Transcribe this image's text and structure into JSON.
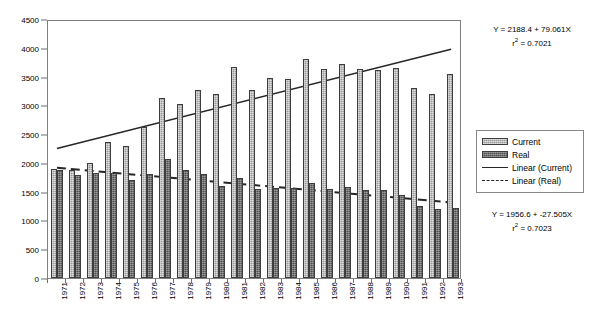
{
  "chart_data": {
    "type": "bar",
    "title": "",
    "xlabel": "",
    "ylabel": "",
    "ylim": [
      0,
      4500
    ],
    "ytick_step": 500,
    "yticks": [
      "0",
      "500",
      "1000",
      "1500",
      "2000",
      "2500",
      "3000",
      "3500",
      "4000",
      "4500"
    ],
    "grid": false,
    "legend_position": "right",
    "categories": [
      "1971",
      "1972",
      "1973",
      "1974",
      "1975",
      "1976",
      "1977",
      "1978",
      "1979",
      "1980",
      "1981",
      "1982",
      "1983",
      "1984",
      "1985",
      "1986",
      "1987",
      "1988",
      "1989",
      "1990",
      "1991",
      "1992",
      "1993"
    ],
    "series": [
      {
        "name": "Current",
        "color": "#9a9a9a",
        "values": [
          1900,
          1880,
          1990,
          2360,
          2300,
          2630,
          3130,
          3030,
          3270,
          3200,
          3660,
          3260,
          3480,
          3450,
          3800,
          3640,
          3710,
          3640,
          3620,
          3650,
          3310,
          3200,
          3540
        ]
      },
      {
        "name": "Real",
        "color": "#4f4f4f",
        "values": [
          1870,
          1790,
          1830,
          1820,
          1700,
          1800,
          2060,
          1870,
          1800,
          1600,
          1740,
          1550,
          1570,
          1560,
          1650,
          1540,
          1590,
          1530,
          1530,
          1440,
          1250,
          1200,
          1220
        ]
      }
    ],
    "trendlines": [
      {
        "name": "Linear (Current)",
        "style": "solid",
        "color": "#262626",
        "intercept": 2188.4,
        "slope": 79.061,
        "r_squared": 0.7021,
        "equation": "Y = 2188.4 + 79.061X",
        "r2_label": "= 0.7021"
      },
      {
        "name": "Linear (Real)",
        "style": "dashed",
        "color": "#262626",
        "intercept": 1956.6,
        "slope": -27.505,
        "r_squared": 0.7023,
        "equation": "Y = 1956.6 + -27.505X",
        "r2_label": "= 0.7023"
      }
    ]
  },
  "legend": {
    "items": [
      {
        "label": "Current",
        "key": "swatch-current"
      },
      {
        "label": "Real",
        "key": "swatch-real"
      },
      {
        "label": "Linear (Current)",
        "key": "solid-line-key"
      },
      {
        "label": "Linear (Real)",
        "key": "dashed-line-key"
      }
    ]
  },
  "annotations": {
    "current_equation": "Y = 2188.4 + 79.061X",
    "current_r2_prefix": "r",
    "current_r2_exp": "2",
    "current_r2_value": "= 0.7021",
    "real_equation": "Y = 1956.6 + -27.505X",
    "real_r2_prefix": "r",
    "real_r2_exp": "2",
    "real_r2_value": "= 0.7023"
  }
}
